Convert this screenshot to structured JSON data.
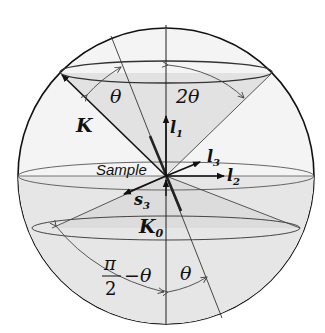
{
  "diagram": {
    "title": "",
    "labels": {
      "K": "K",
      "K0": "K",
      "K0_sub": "0",
      "theta_top": "θ",
      "two_theta": "2θ",
      "l1": "l",
      "l1_sub": "1",
      "l2": "l",
      "l2_sub": "2",
      "l3": "l",
      "l3_sub": "3",
      "s3": "s",
      "s3_sub": "3",
      "sample": "Sample",
      "pi": "π",
      "two": "2",
      "minus_theta": "−θ",
      "theta_bottom": "θ"
    },
    "colors": {
      "background": "#ffffff",
      "sphere_fill": "#f1f1f1",
      "cone_fill": "#e4e4e4",
      "stroke": "#111111",
      "thin_stroke": "#555555"
    }
  }
}
